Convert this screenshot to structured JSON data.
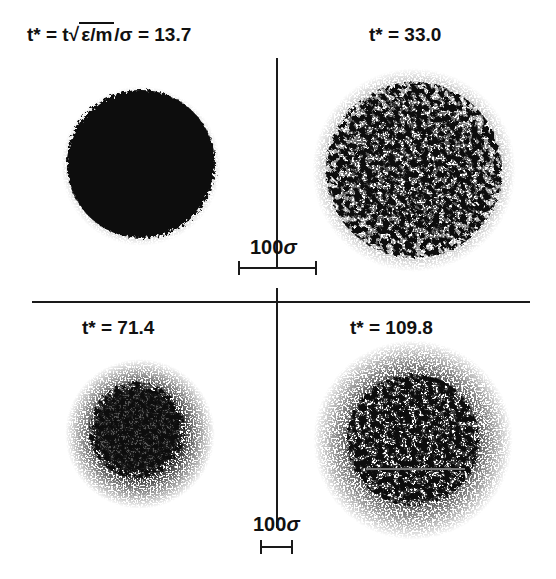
{
  "figure": {
    "panels": [
      {
        "id": "p1",
        "label": "t* = t√ε/m/σ = 13.7",
        "label_prefix": "t* = t",
        "label_radicand": "ε/m",
        "label_suffix": "/σ = 13.7",
        "time": 13.7,
        "style": "dense-solid"
      },
      {
        "id": "p2",
        "label": "t* = 33.0",
        "time": 33.0,
        "style": "porous"
      },
      {
        "id": "p3",
        "label": "t* = 71.4",
        "time": 71.4,
        "style": "dense-halo"
      },
      {
        "id": "p4",
        "label": "t* = 109.8",
        "time": 109.8,
        "style": "porous-halo"
      }
    ],
    "scale_bars": [
      {
        "id": "top",
        "value": "100",
        "unit": "σ"
      },
      {
        "id": "bottom",
        "value": "100",
        "unit": "σ"
      }
    ],
    "colors": {
      "ink": "#111111",
      "background": "#ffffff"
    }
  }
}
